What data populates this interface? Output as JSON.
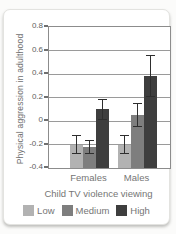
{
  "chart_data": {
    "type": "bar",
    "title": "",
    "ylabel": "Physical aggression in adulthood",
    "legend_title": "Child TV violence viewing",
    "legend_position": "bottom",
    "grid": true,
    "categories": [
      "Females",
      "Males"
    ],
    "series": [
      {
        "name": "Low",
        "color": "#b2b2b2",
        "values": [
          -0.2,
          -0.2
        ],
        "errors": [
          0.08,
          0.08
        ]
      },
      {
        "name": "Medium",
        "color": "#7e7e7e",
        "values": [
          -0.22,
          0.05
        ],
        "errors": [
          0.06,
          0.1
        ]
      },
      {
        "name": "High",
        "color": "#3e3e3e",
        "values": [
          0.1,
          0.38
        ],
        "errors": [
          0.09,
          0.18
        ]
      }
    ],
    "ylim": [
      -0.4,
      0.8
    ],
    "ytick_step": 0.2,
    "yticks": [
      "0.8",
      "0.6",
      "0.4",
      "0.2",
      "0",
      "-0.2",
      "-0.4"
    ],
    "bar_base": -0.4
  },
  "style": {
    "grid_color": "#9a9a9a",
    "axis_color": "#8c8c8c",
    "text_color": "#757575",
    "tick_text_color": "#5e5e5e",
    "error_bar_color": "#2e2e2e",
    "card_background": "#ffffff"
  }
}
